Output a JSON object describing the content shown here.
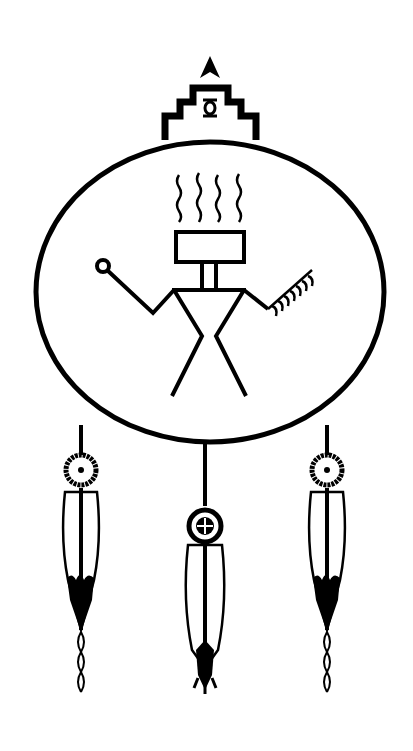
{
  "image": {
    "description": "Black and white ink drawing of a Native American style shield/dreamcatcher with a ceremonial figure and three hanging feathers",
    "colors": {
      "ink": "#000000",
      "background": "#ffffff"
    },
    "elements": {
      "arrowhead": "arrowhead-icon",
      "stepped_pyramid": "stepped-pyramid",
      "turtle_symbol": "turtle-icon",
      "circle": "shield-circle",
      "figure": "stick-figure",
      "smoke_lines": 4,
      "rattle": "rattle-icon",
      "feather_fan": "feather-fan-icon",
      "feathers": [
        {
          "position": "left",
          "medallion": "sunburst",
          "tip": "solid-black"
        },
        {
          "position": "center",
          "medallion": "cross",
          "tip": "claws"
        },
        {
          "position": "right",
          "medallion": "sunburst",
          "tip": "solid-black"
        }
      ]
    }
  }
}
